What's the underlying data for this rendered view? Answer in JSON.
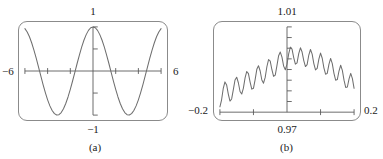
{
  "figure": {
    "background": "#ffffff",
    "frame_color": "#8b8b8b",
    "curve_color": "#6e6e6e",
    "axis_color": "#5a5a5a",
    "text_color": "#1a1a1a"
  },
  "panels": [
    {
      "id": "a",
      "caption": "(a)",
      "labels": {
        "top": "1",
        "bottom": "−1",
        "left": "−6",
        "right": "6"
      }
    },
    {
      "id": "b",
      "caption": "(b)",
      "labels": {
        "top": "1.01",
        "bottom": "0.97",
        "left": "−0.2",
        "right": "0.2"
      }
    }
  ],
  "chart_data": [
    {
      "type": "line",
      "title": "",
      "subtitle": "",
      "xlabel": "",
      "ylabel": "",
      "xlim": [
        -6,
        6
      ],
      "ylim": [
        -1,
        1
      ],
      "xticks": [
        -6,
        -4,
        -2,
        0,
        2,
        4,
        6
      ],
      "yticks": [
        -1,
        -0.5,
        0,
        0.5,
        1
      ],
      "xtick_labels": [
        "−6",
        "",
        "",
        "",
        "",
        "",
        "6"
      ],
      "ytick_labels": [
        "−1",
        "",
        "",
        "",
        "1"
      ],
      "grid": false,
      "legend": "none",
      "axes_through_origin": true,
      "annotation": "(a)",
      "series": [
        {
          "name": "cos(x)",
          "x": [
            -6.0,
            -5.8,
            -5.6,
            -5.4,
            -5.2,
            -5.0,
            -4.8,
            -4.6,
            -4.4,
            -4.2,
            -4.0,
            -3.8,
            -3.6,
            -3.4,
            -3.2,
            -3.0,
            -2.8,
            -2.6,
            -2.4,
            -2.2,
            -2.0,
            -1.8,
            -1.6,
            -1.4,
            -1.2,
            -1.0,
            -0.8,
            -0.6,
            -0.4,
            -0.2,
            0.0,
            0.2,
            0.4,
            0.6,
            0.8,
            1.0,
            1.2,
            1.4,
            1.6,
            1.8,
            2.0,
            2.2,
            2.4,
            2.6,
            2.8,
            3.0,
            3.2,
            3.4,
            3.6,
            3.8,
            4.0,
            4.2,
            4.4,
            4.6,
            4.8,
            5.0,
            5.2,
            5.4,
            5.6,
            5.8,
            6.0
          ],
          "y": [
            0.96,
            0.886,
            0.776,
            0.635,
            0.469,
            0.284,
            0.087,
            -0.112,
            -0.307,
            -0.49,
            -0.654,
            -0.791,
            -0.897,
            -0.967,
            -0.998,
            -0.99,
            -0.942,
            -0.857,
            -0.737,
            -0.589,
            -0.416,
            -0.227,
            -0.029,
            0.17,
            0.362,
            0.54,
            0.697,
            0.825,
            0.921,
            0.98,
            1.0,
            0.98,
            0.921,
            0.825,
            0.697,
            0.54,
            0.362,
            0.17,
            -0.029,
            -0.227,
            -0.416,
            -0.589,
            -0.737,
            -0.857,
            -0.942,
            -0.99,
            -0.998,
            -0.967,
            -0.897,
            -0.791,
            -0.654,
            -0.49,
            -0.307,
            -0.112,
            0.087,
            0.284,
            0.469,
            0.635,
            0.776,
            0.886,
            0.96
          ]
        }
      ]
    },
    {
      "type": "line",
      "title": "",
      "subtitle": "",
      "xlabel": "",
      "ylabel": "",
      "xlim": [
        -0.2,
        0.2
      ],
      "ylim": [
        0.97,
        1.01
      ],
      "xticks": [
        -0.2,
        -0.1,
        0.0,
        0.1,
        0.2
      ],
      "yticks": [
        0.97,
        0.975,
        0.98,
        0.985,
        0.99,
        0.995,
        1.0,
        1.005,
        1.01
      ],
      "xtick_labels": [
        "−0.2",
        "",
        "0.97",
        "",
        "0.2"
      ],
      "ytick_labels": [
        "0.97",
        "",
        "",
        "",
        "",
        "",
        "",
        "",
        "1.01"
      ],
      "grid": false,
      "legend": "none",
      "axes_through_origin": true,
      "annotation": "(b)",
      "description": "Zoomed view near the maximum: smooth cosine envelope with high-frequency ripple, about 16 ripple cycles across the window.",
      "series": [
        {
          "name": "zoomed cos(x) with high-frequency ripple",
          "x": [
            -0.2,
            -0.195,
            -0.19,
            -0.185,
            -0.18,
            -0.175,
            -0.17,
            -0.165,
            -0.16,
            -0.155,
            -0.15,
            -0.145,
            -0.14,
            -0.135,
            -0.13,
            -0.125,
            -0.12,
            -0.115,
            -0.11,
            -0.105,
            -0.1,
            -0.095,
            -0.09,
            -0.085,
            -0.08,
            -0.075,
            -0.07,
            -0.065,
            -0.06,
            -0.055,
            -0.05,
            -0.045,
            -0.04,
            -0.035,
            -0.03,
            -0.025,
            -0.02,
            -0.015,
            -0.01,
            -0.005,
            0.0,
            0.005,
            0.01,
            0.015,
            0.02,
            0.025,
            0.03,
            0.035,
            0.04,
            0.045,
            0.05,
            0.055,
            0.06,
            0.065,
            0.07,
            0.075,
            0.08,
            0.085,
            0.09,
            0.095,
            0.1,
            0.105,
            0.11,
            0.115,
            0.12,
            0.125,
            0.13,
            0.135,
            0.14,
            0.145,
            0.15,
            0.155,
            0.16,
            0.165,
            0.17,
            0.175,
            0.18,
            0.185,
            0.19,
            0.195,
            0.2
          ],
          "y": [
            0.9725,
            0.9758,
            0.9812,
            0.9842,
            0.9828,
            0.9785,
            0.9752,
            0.9762,
            0.9806,
            0.9851,
            0.9864,
            0.9838,
            0.9797,
            0.9785,
            0.9813,
            0.9861,
            0.9891,
            0.9881,
            0.9841,
            0.9808,
            0.9812,
            0.9853,
            0.9901,
            0.9918,
            0.9893,
            0.9851,
            0.9836,
            0.9863,
            0.9913,
            0.9947,
            0.9939,
            0.9899,
            0.9868,
            0.9874,
            0.9918,
            0.9965,
            0.9982,
            0.9958,
            0.9916,
            0.9899,
            0.9925,
            0.9973,
            1.0005,
            0.9996,
            0.9956,
            0.9925,
            0.9931,
            0.9975,
            1.0002,
            0.9982,
            0.9942,
            0.9914,
            0.9923,
            0.9968,
            0.9994,
            0.9972,
            0.9928,
            0.9898,
            0.9905,
            0.9949,
            0.9977,
            0.9953,
            0.9908,
            0.9878,
            0.9882,
            0.9924,
            0.9952,
            0.9928,
            0.9882,
            0.985,
            0.9853,
            0.9893,
            0.992,
            0.9896,
            0.985,
            0.9816,
            0.9818,
            0.9856,
            0.9882,
            0.9857,
            0.9812
          ]
        }
      ]
    }
  ]
}
